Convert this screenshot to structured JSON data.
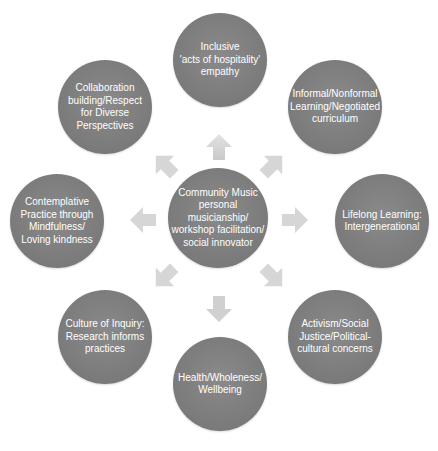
{
  "diagram": {
    "type": "radial-cycle",
    "center": {
      "label": "Community Music\npersonal musicianship/\nworkshop facilitation/\nsocial innovator"
    },
    "satellites": [
      {
        "position": "top",
        "label": "Inclusive\n'acts of hospitality'\nempathy"
      },
      {
        "position": "top-right",
        "label": "Informal/Nonformal\nLearning/Negotiated\ncurriculum"
      },
      {
        "position": "right",
        "label": "Lifelong Learning:\nIntergenerational"
      },
      {
        "position": "bottom-right",
        "label": "Activism/Social\nJustice/Political-\ncultural concerns"
      },
      {
        "position": "bottom",
        "label": "Health/Wholeness/\nWellbeing"
      },
      {
        "position": "bottom-left",
        "label": "Culture of Inquiry:\nResearch informs\npractices"
      },
      {
        "position": "left",
        "label": "Contemplative\nPractice through\nMindfulness/\nLoving kindness"
      },
      {
        "position": "top-left",
        "label": "Collaboration\nbuilding/Respect\nfor Diverse\nPerspectives"
      }
    ],
    "arrows": [
      "up",
      "up-right",
      "right",
      "down-right",
      "down",
      "down-left",
      "left",
      "up-left"
    ],
    "colors": {
      "node_fill": "#7d7d7d",
      "node_text": "#ffffff",
      "arrow_fill": "#d3d3d3",
      "background": "#ffffff"
    }
  }
}
